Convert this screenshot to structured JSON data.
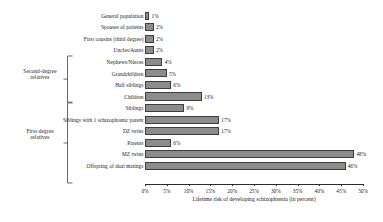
{
  "chart_data": {
    "type": "bar",
    "orientation": "horizontal",
    "title": "",
    "xlabel": "Lifetime risk of developing schizophrenia (in percent)",
    "ylabel": "",
    "xlim": [
      0,
      50
    ],
    "xticks": [
      "0%",
      "5%",
      "10%",
      "15%",
      "20%",
      "25%",
      "30%",
      "35%",
      "40%",
      "45%",
      "50%"
    ],
    "xtick_values": [
      0,
      5,
      10,
      15,
      20,
      25,
      30,
      35,
      40,
      45,
      50
    ],
    "grid": false,
    "legend": null,
    "categories": [
      "General population",
      "Spouses of patients",
      "First cousins (third degree)",
      "Uncles/Aunts",
      "Nephews/Nieces",
      "Grandchildren",
      "Half siblings",
      "Children",
      "Siblings",
      "Siblings with 1 schizophrenic parent",
      "DZ twins",
      "Parents",
      "MZ twins",
      "Offspring of dual matings"
    ],
    "values": [
      1,
      2,
      2,
      2,
      4,
      5,
      6,
      13,
      9,
      17,
      17,
      6,
      48,
      46
    ],
    "value_labels": [
      "1%",
      "2%",
      "2%",
      "2%",
      "4%",
      "5%",
      "6%",
      "13%",
      "9%",
      "17%",
      "17%",
      "6%",
      "48%",
      "46%"
    ],
    "bar_color": "#8c8c8c",
    "bar_edge_color": "#3d3d3d",
    "annotations": [
      {
        "label": "Second-degree\nrelatives",
        "label_line1": "Second-degree",
        "label_line2": "relatives",
        "covers_categories": [
          "Nephews/Nieces",
          "Grandchildren",
          "Half siblings",
          "Children"
        ]
      },
      {
        "label": "First-degree\nrelatives",
        "label_line1": "First-degree",
        "label_line2": "relatives",
        "covers_categories": [
          "Children",
          "Siblings",
          "Siblings with 1 schizophrenic parent",
          "DZ twins",
          "Parents",
          "MZ twins",
          "Offspring of dual matings"
        ]
      }
    ]
  },
  "groups": {
    "second_degree": {
      "line1": "Second-degree",
      "line2": "relatives"
    },
    "first_degree": {
      "line1": "First-degree",
      "line2": "relatives"
    }
  }
}
